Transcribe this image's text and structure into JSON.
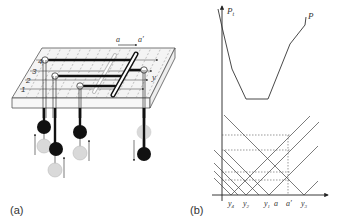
{
  "figure": {
    "panel_a": {
      "label": "(a)",
      "top_arrow": {
        "from_label": "a",
        "to_label": "a′"
      },
      "axis_label": "y",
      "row_labels": [
        "1",
        "2",
        "3",
        "4"
      ],
      "pendulums": [
        {
          "id": "p4",
          "direction": "up",
          "state": "black-above-grey"
        },
        {
          "id": "p3",
          "direction": "up",
          "state": "black-above-grey"
        },
        {
          "id": "p2",
          "direction": "up",
          "state": "black-above-grey"
        },
        {
          "id": "p1",
          "direction": "down",
          "state": "grey-above-black"
        }
      ],
      "colors": {
        "bar": "#111111",
        "ghost_bar": "#bbbbbb",
        "ball_dark": "#111111",
        "ball_light": "#d9d9d9",
        "grid": "#888888"
      }
    },
    "panel_b": {
      "label": "(b)",
      "y_axis_label": "P",
      "y_axis_subscript": "t",
      "curve_label": "P",
      "x_ticks": [
        {
          "label": "y",
          "sub": "4"
        },
        {
          "label": "y",
          "sub": "2"
        },
        {
          "label": "y",
          "sub": "1"
        },
        {
          "label": "a",
          "sub": ""
        },
        {
          "label": "a′",
          "sub": ""
        },
        {
          "label": "y",
          "sub": "3"
        }
      ]
    }
  }
}
